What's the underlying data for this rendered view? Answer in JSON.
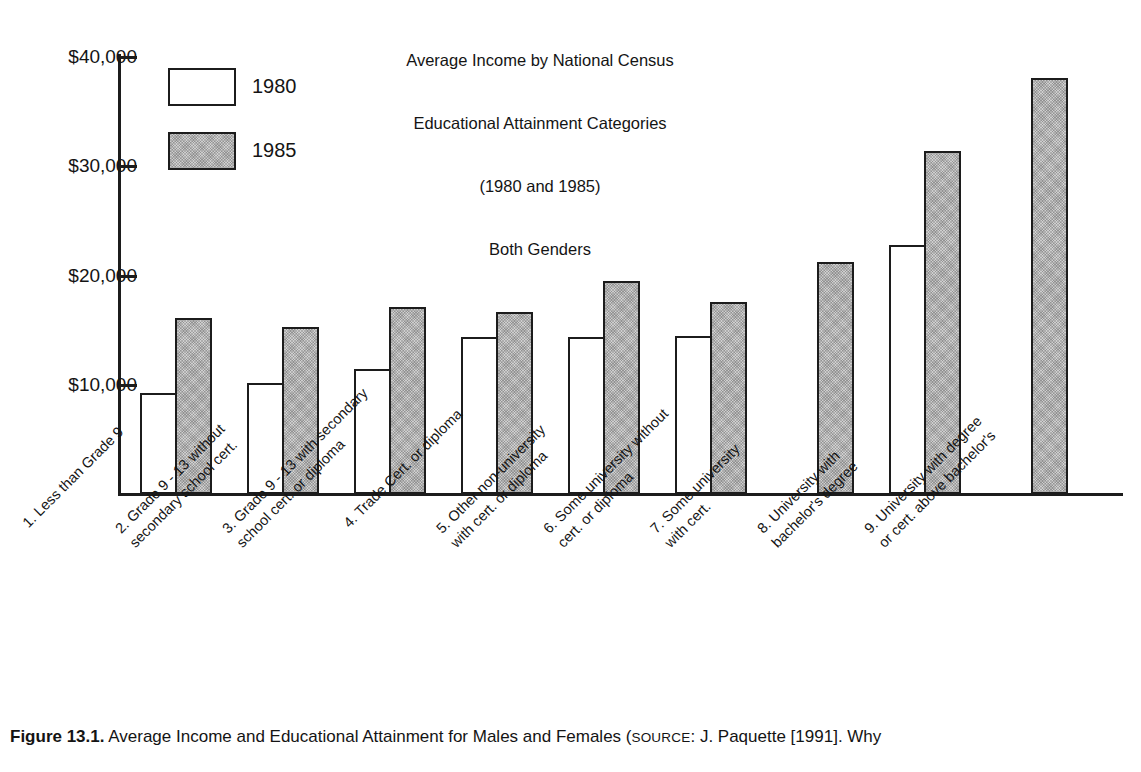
{
  "chart_data": {
    "type": "bar",
    "title": "Average Income by National Census Educational Attainment Categories (1980 and 1985) Both Genders",
    "title_lines": [
      "Average Income by National Census",
      "Educational Attainment Categories",
      "(1980 and 1985)",
      "Both Genders"
    ],
    "xlabel": "",
    "ylabel": "",
    "ylim": [
      0,
      40000
    ],
    "grid": false,
    "legend_position": "upper-left-inside",
    "y_ticks": [
      {
        "value": 40000,
        "label": "$40,000"
      },
      {
        "value": 30000,
        "label": "$30,000"
      },
      {
        "value": 20000,
        "label": "$20,000"
      },
      {
        "value": 10000,
        "label": "$10,000"
      }
    ],
    "categories": [
      "1. Less than Grade 9",
      "2. Grade 9 - 13 without secondary school cert.",
      "3. Grade 9 - 13 with secondary school cert. or diploma",
      "4. Trade Cert. or diploma",
      "5. Other non-university with cert. or diploma",
      "6. Some university without cert. or diploma",
      "7. Some university with cert.",
      "8. University with bachelor's degree",
      "9. University with degree or cert. above bachelor's"
    ],
    "category_label_lines": [
      [
        "1. Less than Grade 9",
        ""
      ],
      [
        "2. Grade 9 - 13 without",
        "secondary school cert."
      ],
      [
        "3. Grade 9 - 13 with secondary",
        "school cert. or diploma"
      ],
      [
        "4. Trade Cert. or diploma",
        ""
      ],
      [
        "5. Other non-university",
        "with cert. or diploma"
      ],
      [
        "6. Some university without",
        "cert. or diploma"
      ],
      [
        "7. Some university",
        "with cert."
      ],
      [
        "8. University with",
        "bachelor's degree"
      ],
      [
        "9. University with degree",
        "or cert. above bachelor's"
      ]
    ],
    "series": [
      {
        "name": "1980",
        "fill": "#ffffff",
        "values": [
          9200,
          10200,
          11400,
          14400,
          14400,
          14500,
          null,
          22800,
          null
        ]
      },
      {
        "name": "1985",
        "fill": "#cfcfcf",
        "values": [
          16100,
          15300,
          17100,
          16700,
          19500,
          17600,
          21200,
          31400,
          38100
        ]
      }
    ]
  },
  "legend": {
    "items": [
      {
        "label": "1980",
        "swatch": "white-bar-swatch"
      },
      {
        "label": "1985",
        "swatch": "shaded-bar-swatch"
      }
    ]
  },
  "caption": {
    "figure_number": "Figure 13.1.",
    "text_before_source": " Average Income and Educational Attainment for Males and Females (",
    "source_label": "SOURCE",
    "text_after_source": ": J. Paquette [1991]. Why"
  },
  "colors": {
    "ink": "#1c1c1c",
    "bar_1980": "#ffffff",
    "bar_1985": "#cfcfcf",
    "background": "#ffffff"
  }
}
